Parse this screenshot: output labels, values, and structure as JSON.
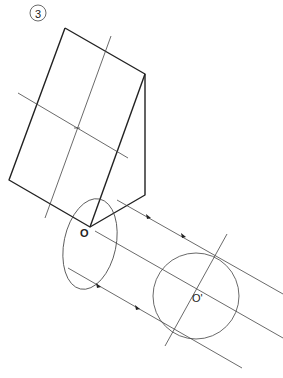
{
  "figure": {
    "step_number": "3",
    "labels": {
      "origin": "O",
      "projected_origin": "O'"
    },
    "colors": {
      "line": "#222222",
      "thin_line": "#444444",
      "background": "#ffffff"
    }
  }
}
